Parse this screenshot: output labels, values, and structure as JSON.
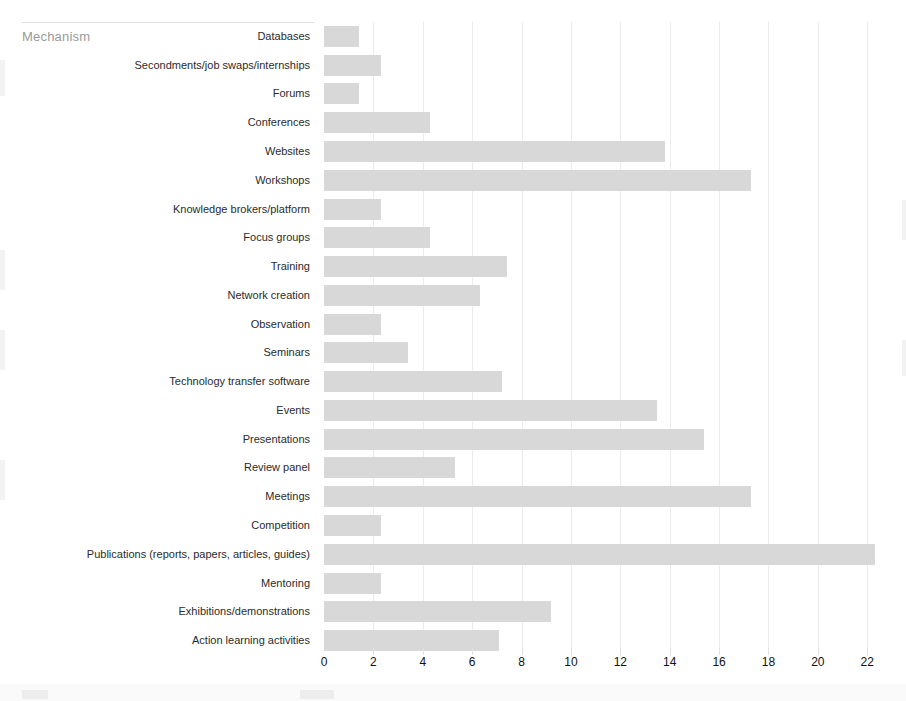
{
  "axis_title": "Mechanism",
  "chart_data": {
    "type": "bar",
    "orientation": "horizontal",
    "title": "",
    "subtitle": "",
    "xlabel": "",
    "ylabel": "Mechanism",
    "xlim": [
      0,
      22.8
    ],
    "xticks": [
      0,
      2,
      4,
      6,
      8,
      10,
      12,
      14,
      16,
      18,
      20,
      22
    ],
    "grid": "vertical",
    "legend": "none",
    "bar_color": "#d8d8d8",
    "categories": [
      "Databases",
      "Secondments/job swaps/internships",
      "Forums",
      "Conferences",
      "Websites",
      "Workshops",
      "Knowledge brokers/platform",
      "Focus groups",
      "Training",
      "Network creation",
      "Observation",
      "Seminars",
      "Technology transfer software",
      "Events",
      "Presentations",
      "Review panel",
      "Meetings",
      "Competition",
      "Publications (reports, papers, articles, guides)",
      "Mentoring",
      "Exhibitions/demonstrations",
      "Action learning activities"
    ],
    "values": [
      1.4,
      2.3,
      1.4,
      4.3,
      13.8,
      17.3,
      2.3,
      4.3,
      7.4,
      6.3,
      2.3,
      3.4,
      7.2,
      13.5,
      15.4,
      5.3,
      17.3,
      2.3,
      22.3,
      2.3,
      9.2,
      7.1
    ]
  }
}
